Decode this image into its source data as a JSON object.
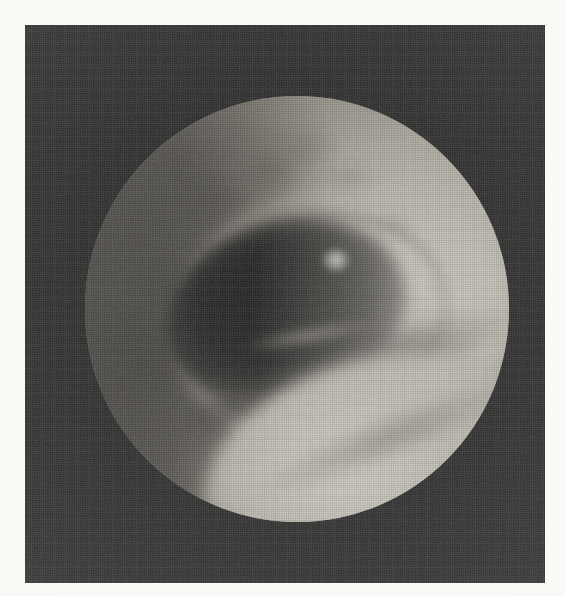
{
  "document": {
    "kind": "printed-halftone-photograph",
    "page_background": "#fbfaf7",
    "plate_background": "#0c0c0c"
  },
  "figure": {
    "title": "",
    "caption": "",
    "modality": "endoscopy",
    "color_mode": "grayscale",
    "orientation": "portrait"
  },
  "plate": {
    "name": "photographic-plate",
    "x": 25,
    "y": 25,
    "width": 520,
    "height": 558,
    "fill": "#0c0c0c"
  },
  "field_of_view": {
    "name": "circular-endoscope-field",
    "shape": "circle",
    "center_x": 296,
    "center_y": 308,
    "radius": 212,
    "left": 85,
    "top": 96,
    "right": 507,
    "bottom": 520
  },
  "regions": [
    {
      "name": "central-lumen",
      "label": "dark airway lumen",
      "tone": "darkest",
      "hex": "#0a0a09",
      "position": "center, slightly left and above center"
    },
    {
      "name": "bright-mucosal-fold",
      "label": "bright mucosal fold",
      "tone": "brightest",
      "hex": "#f0ece2",
      "position": "lower-right of lumen"
    },
    {
      "name": "shadow-groove",
      "label": "shadow groove between folds",
      "tone": "dark",
      "hex": "#1a1917",
      "position": "between lumen and bright fold"
    },
    {
      "name": "right-rim-crescent",
      "label": "illuminated crescent along right rim",
      "tone": "bright",
      "hex": "#e7e2d6",
      "position": "right edge of field"
    },
    {
      "name": "upper-left-mucosa",
      "label": "dim textured mucosa",
      "tone": "mid-dark",
      "hex": "#6a655b",
      "position": "upper-left quadrant"
    },
    {
      "name": "lower-left-mucosa",
      "label": "shadowed mucosa",
      "tone": "dark",
      "hex": "#4a463f",
      "position": "lower-left quadrant"
    },
    {
      "name": "specular-highlight",
      "label": "specular light reflection",
      "tone": "white",
      "hex": "#fcfaf5",
      "position": "upper-middle, right of center"
    },
    {
      "name": "cartilage-ridge",
      "label": "concentric ring ridge",
      "tone": "mid",
      "hex": "#a49e90",
      "position": "encircling the lumen"
    }
  ],
  "margins": {
    "top": 25,
    "left": 25,
    "right": 21,
    "bottom": 13
  },
  "texture": {
    "print_screen": "halftone-dot",
    "dot_pitch_px": 2.2,
    "grain": "film-grain"
  }
}
